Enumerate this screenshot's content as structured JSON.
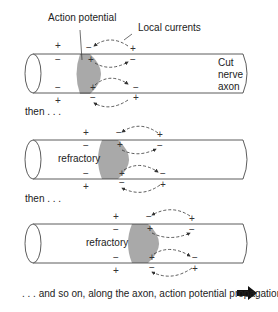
{
  "labels": {
    "action_potential": "Action potential",
    "local_currents": "Local currents",
    "cut_nerve_axon": [
      "Cut",
      "nerve",
      "axon"
    ],
    "then_1": "then . . .",
    "then_2": "then . . .",
    "refractory_1": "refractory",
    "refractory_2": "refractory",
    "caption": ". . . and so on, along the axon, action potential propagation"
  },
  "symbols": {
    "plus": "+",
    "minus": "−"
  },
  "colors": {
    "depolarized": "#a9a9a9",
    "stroke": "#333333",
    "text": "#222222"
  },
  "icons": {
    "propagation_arrow": "right-arrow-icon"
  }
}
